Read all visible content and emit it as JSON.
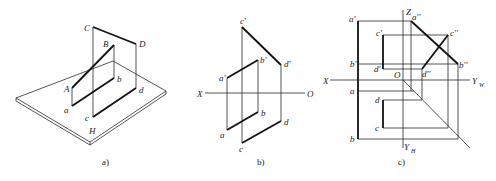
{
  "figure": {
    "panels": [
      {
        "id": "a",
        "caption": "a)",
        "type": "isometric",
        "plane_label": "H",
        "points_space": [
          "A",
          "B",
          "C",
          "D"
        ],
        "points_projection": [
          "a",
          "b",
          "c",
          "d"
        ]
      },
      {
        "id": "b",
        "caption": "b)",
        "type": "two-view projection",
        "axis_labels": {
          "left": "X",
          "right": "O"
        },
        "front_labels": [
          "a'",
          "b'",
          "c'",
          "d'"
        ],
        "top_labels": [
          "a",
          "b",
          "c",
          "d"
        ]
      },
      {
        "id": "c",
        "caption": "c)",
        "type": "three-view projection",
        "axis_labels": {
          "z": "Z",
          "x": "X",
          "origin": "O",
          "yw": "Y",
          "yw_sub": "W",
          "yh": "Y",
          "yh_sub": "H"
        },
        "front_labels": [
          "a'",
          "b'",
          "c'",
          "d'"
        ],
        "side_labels": [
          "a''",
          "b''",
          "c''",
          "d''"
        ],
        "top_labels": [
          "a",
          "b",
          "c",
          "d"
        ]
      }
    ]
  },
  "labels": {
    "a_C": "C",
    "a_D": "D",
    "a_B": "B",
    "a_A": "A",
    "a_a": "a",
    "a_b": "b",
    "a_c": "c",
    "a_d": "d",
    "a_H": "H",
    "b_cp": "c'",
    "b_dp": "d'",
    "b_ap": "a'",
    "b_bp": "b'",
    "b_a": "a",
    "b_b": "b",
    "b_c": "c",
    "b_d": "d",
    "b_X": "X",
    "b_O": "O",
    "c_Z": "Z",
    "c_ap": "a'",
    "c_app": "a''",
    "c_cp": "c'",
    "c_cpp": "c''",
    "c_bp": "b'",
    "c_bpp": "b''",
    "c_dp": "d'",
    "c_dpp": "d''",
    "c_X": "X",
    "c_O": "O",
    "c_YW": "Y",
    "c_W": "W",
    "c_a": "a",
    "c_d": "d",
    "c_c": "c",
    "c_b": "b",
    "c_YH": "Y",
    "c_H": "H",
    "cap_a": "a)",
    "cap_b": "b)",
    "cap_c": "c)"
  }
}
